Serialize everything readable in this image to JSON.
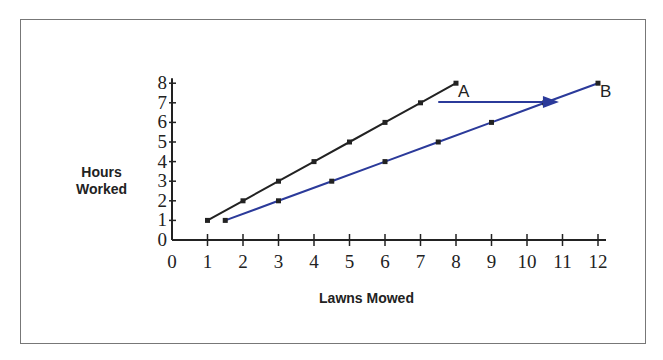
{
  "chart_data": {
    "type": "line",
    "title": "",
    "xlabel": "Lawns Mowed",
    "ylabel": "Hours Worked",
    "xlim": [
      0,
      12
    ],
    "ylim": [
      0,
      8
    ],
    "x_ticks": [
      0,
      1,
      2,
      3,
      4,
      5,
      6,
      7,
      8,
      9,
      10,
      11,
      12
    ],
    "y_ticks": [
      0,
      1,
      2,
      3,
      4,
      5,
      6,
      7,
      8
    ],
    "grid": false,
    "series": [
      {
        "name": "A",
        "color": "#222222",
        "x": [
          1,
          2,
          3,
          4,
          5,
          6,
          7,
          8
        ],
        "y": [
          1,
          2,
          3,
          4,
          5,
          6,
          7,
          8
        ]
      },
      {
        "name": "B",
        "color": "#2b3a9a",
        "x": [
          1.5,
          3,
          4.5,
          6,
          7.5,
          9,
          10.5,
          12
        ],
        "y": [
          1,
          2,
          3,
          4,
          5,
          6,
          7,
          8
        ]
      }
    ],
    "annotations": [
      {
        "type": "arrow",
        "from": [
          7.5,
          7.2
        ],
        "to": [
          10.9,
          7.2
        ],
        "color": "#2b3a9a",
        "note": "horizontal arrow from line A toward line B"
      }
    ]
  },
  "labels": {
    "ylabel_line1": "Hours",
    "ylabel_line2": "Worked",
    "xlabel": "Lawns Mowed"
  }
}
